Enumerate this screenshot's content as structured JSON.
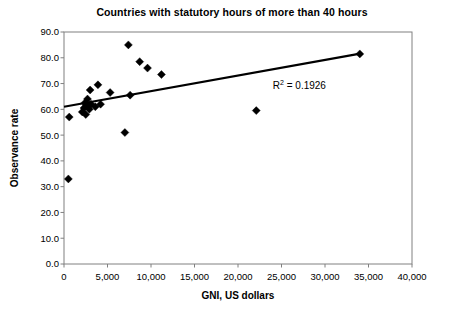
{
  "chart_data": {
    "type": "scatter",
    "title": "Countries with statutory hours of more than 40 hours",
    "xlabel": "GNI, US dollars",
    "ylabel": "Observance rate",
    "xlim": [
      0,
      40000
    ],
    "ylim": [
      0,
      90
    ],
    "grid": false,
    "legend": null,
    "xticks": [
      0,
      5000,
      10000,
      15000,
      20000,
      25000,
      30000,
      35000,
      40000
    ],
    "xtick_labels": [
      "0",
      "5,000",
      "10,000",
      "15,000",
      "20,000",
      "25,000",
      "30,000",
      "35,000",
      "40,000"
    ],
    "yticks": [
      0,
      10,
      20,
      30,
      40,
      50,
      60,
      70,
      80,
      90
    ],
    "ytick_labels": [
      "0.0",
      "10.0",
      "20.0",
      "30.0",
      "40.0",
      "50.0",
      "60.0",
      "70.0",
      "80.0",
      "90.0"
    ],
    "points": [
      {
        "x": 500,
        "y": 33.0
      },
      {
        "x": 600,
        "y": 57.0
      },
      {
        "x": 2100,
        "y": 59.0
      },
      {
        "x": 2300,
        "y": 60.5
      },
      {
        "x": 2400,
        "y": 62.5
      },
      {
        "x": 2500,
        "y": 58.0
      },
      {
        "x": 2600,
        "y": 61.5
      },
      {
        "x": 2700,
        "y": 64.0
      },
      {
        "x": 2900,
        "y": 60.0
      },
      {
        "x": 3000,
        "y": 67.5
      },
      {
        "x": 3100,
        "y": 62.0
      },
      {
        "x": 3600,
        "y": 61.0
      },
      {
        "x": 3900,
        "y": 69.5
      },
      {
        "x": 4200,
        "y": 62.0
      },
      {
        "x": 5300,
        "y": 66.5
      },
      {
        "x": 7000,
        "y": 51.0
      },
      {
        "x": 7400,
        "y": 85.0
      },
      {
        "x": 7600,
        "y": 65.5
      },
      {
        "x": 8700,
        "y": 78.5
      },
      {
        "x": 9600,
        "y": 76.0
      },
      {
        "x": 11200,
        "y": 73.5
      },
      {
        "x": 22100,
        "y": 59.5
      },
      {
        "x": 34000,
        "y": 81.5
      }
    ],
    "trendline": {
      "x_start": 0,
      "y_start": 61.0,
      "x_end": 34200,
      "y_end": 81.7
    },
    "annotations": [
      {
        "text_prefix": "R",
        "text_sup": "2",
        "text_suffix": " = 0.1926",
        "x": 24000,
        "y": 68.0
      }
    ]
  },
  "colors": {
    "marker": "#000000",
    "trendline": "#000000",
    "frame": "#808080",
    "text": "#000000",
    "background": "#ffffff"
  }
}
